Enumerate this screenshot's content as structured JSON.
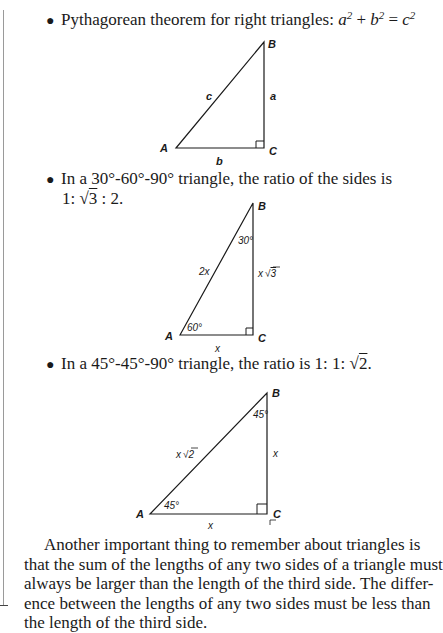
{
  "bullets": [
    {
      "text": "Pythagorean theorem for right triangles: ",
      "formula": {
        "a": "a",
        "b": "b",
        "c": "c",
        "exp": "2",
        "plus": " + ",
        "eq": " = "
      }
    },
    {
      "text": "In a 30°-60°-90° triangle, the ratio of the sides is",
      "cont_prefix": "1: ",
      "cont_radicand": "3",
      "cont_suffix": " : 2."
    },
    {
      "text_prefix": "In a 45°-45°-90° triangle, the ratio is 1: 1: ",
      "radicand": "2",
      "suffix": "."
    }
  ],
  "figures": {
    "pythagorean": {
      "vertices": {
        "A": "A",
        "B": "B",
        "C": "C"
      },
      "sides": {
        "hypotenuse": "c",
        "vertical": "a",
        "base": "b"
      }
    },
    "triangle_30_60_90": {
      "vertices": {
        "A": "A",
        "B": "B",
        "C": "C"
      },
      "angles": {
        "B": "30°",
        "A": "60°"
      },
      "sides": {
        "hypotenuse": "2x",
        "vertical_prefix": "x",
        "vertical_radicand": "3",
        "base": "x"
      }
    },
    "triangle_45_45_90": {
      "vertices": {
        "A": "A",
        "B": "B",
        "C": "C"
      },
      "angles": {
        "B": "45°",
        "A": "45°"
      },
      "sides": {
        "hypotenuse_prefix": "x",
        "hypotenuse_radicand": "2",
        "vertical": "x",
        "base": "x"
      }
    }
  },
  "paragraph": {
    "lines": [
      "Another important thing to remember about triangles is",
      "that the sum of the lengths of any two sides of a triangle must",
      "always be larger than the length of the third side. The differ-",
      "ence between the lengths of any two sides must be less than",
      "the length of the third side."
    ]
  }
}
